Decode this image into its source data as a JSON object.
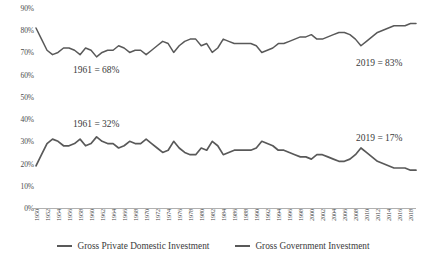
{
  "chart_data": {
    "type": "line",
    "title": "",
    "xlabel": "",
    "ylabel": "",
    "ylim": [
      0,
      90
    ],
    "ytick_step": 10,
    "ytick_labels": [
      "0%",
      "10%",
      "20%",
      "30%",
      "40%",
      "50%",
      "60%",
      "70%",
      "80%",
      "90%"
    ],
    "grid": false,
    "legend_position": "bottom-center",
    "xtick_labels": [
      "1950",
      "1952",
      "1954",
      "1956",
      "1958",
      "1960",
      "1962",
      "1964",
      "1966",
      "1968",
      "1970",
      "1972",
      "1974",
      "1976",
      "1978",
      "1980",
      "1982",
      "1984",
      "1986",
      "1988",
      "1990",
      "1992",
      "1994",
      "1996",
      "1998",
      "2000",
      "2002",
      "2004",
      "2006",
      "2008",
      "2010",
      "2012",
      "2014",
      "2016",
      "2018"
    ],
    "x": [
      1950,
      1951,
      1952,
      1953,
      1954,
      1955,
      1956,
      1957,
      1958,
      1959,
      1960,
      1961,
      1962,
      1963,
      1964,
      1965,
      1966,
      1967,
      1968,
      1969,
      1970,
      1971,
      1972,
      1973,
      1974,
      1975,
      1976,
      1977,
      1978,
      1979,
      1980,
      1981,
      1982,
      1983,
      1984,
      1985,
      1986,
      1987,
      1988,
      1989,
      1990,
      1991,
      1992,
      1993,
      1994,
      1995,
      1996,
      1997,
      1998,
      1999,
      2000,
      2001,
      2002,
      2003,
      2004,
      2005,
      2006,
      2007,
      2008,
      2009,
      2010,
      2011,
      2012,
      2013,
      2014,
      2015,
      2016,
      2017,
      2018,
      2019
    ],
    "series": [
      {
        "name": "Gross Private Domestic Investment",
        "color": "#595959",
        "values": [
          81,
          76,
          71,
          69,
          70,
          72,
          72,
          71,
          69,
          72,
          71,
          68,
          70,
          71,
          71,
          73,
          72,
          70,
          71,
          71,
          69,
          71,
          73,
          75,
          74,
          70,
          73,
          75,
          76,
          76,
          73,
          74,
          70,
          72,
          76,
          75,
          74,
          74,
          74,
          74,
          73,
          70,
          71,
          72,
          74,
          74,
          75,
          76,
          77,
          77,
          78,
          76,
          76,
          77,
          78,
          79,
          79,
          78,
          76,
          73,
          75,
          77,
          79,
          80,
          81,
          82,
          82,
          82,
          83,
          83
        ]
      },
      {
        "name": "Gross Government Investment",
        "color": "#595959",
        "values": [
          19,
          24,
          29,
          31,
          30,
          28,
          28,
          29,
          31,
          28,
          29,
          32,
          30,
          29,
          29,
          27,
          28,
          30,
          29,
          29,
          31,
          29,
          27,
          25,
          26,
          30,
          27,
          25,
          24,
          24,
          27,
          26,
          30,
          28,
          24,
          25,
          26,
          26,
          26,
          26,
          27,
          30,
          29,
          28,
          26,
          26,
          25,
          24,
          23,
          23,
          22,
          24,
          24,
          23,
          22,
          21,
          21,
          22,
          24,
          27,
          25,
          23,
          21,
          20,
          19,
          18,
          18,
          18,
          17,
          17
        ]
      }
    ],
    "annotations": [
      {
        "id": "private-1961",
        "text": "1961 = 68%"
      },
      {
        "id": "private-2019",
        "text": "2019 = 83%"
      },
      {
        "id": "govt-1961",
        "text": "1961 = 32%"
      },
      {
        "id": "govt-2019",
        "text": "2019 = 17%"
      }
    ]
  }
}
